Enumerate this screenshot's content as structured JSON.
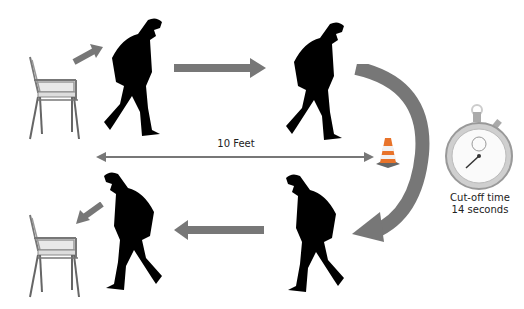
{
  "diagram": {
    "distance_label": "10 Feet",
    "timer": {
      "label_line1": "Cut-off time",
      "label_line2": "14 seconds",
      "icon": "stopwatch-icon"
    },
    "steps": [
      {
        "id": "stand-up",
        "icon": "chair-icon"
      },
      {
        "id": "walk-forward",
        "icon": "walking-person-icon"
      },
      {
        "id": "turn-at-cone",
        "icon": "traffic-cone-icon"
      },
      {
        "id": "walk-back",
        "icon": "walking-person-icon"
      },
      {
        "id": "sit-down",
        "icon": "chair-icon"
      }
    ],
    "colors": {
      "arrow": "#777777",
      "silhouette": "#000000",
      "cone_orange": "#e8732a",
      "background": "#ffffff"
    }
  }
}
